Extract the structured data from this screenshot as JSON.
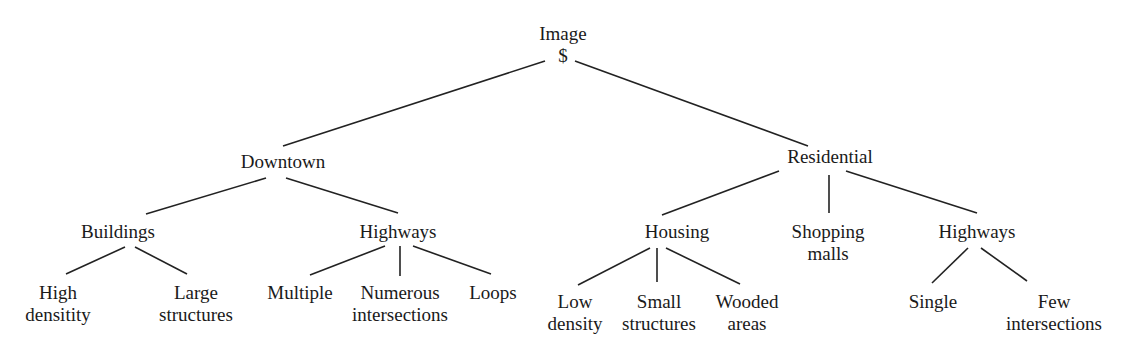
{
  "diagram": {
    "type": "tree",
    "root": {
      "label": "Image",
      "symbol": "$"
    },
    "level1": [
      {
        "id": "downtown",
        "label": "Downtown"
      },
      {
        "id": "residential",
        "label": "Residential"
      }
    ],
    "level2": [
      {
        "id": "buildings",
        "parent": "downtown",
        "lines": [
          "Buildings"
        ]
      },
      {
        "id": "highways_dt",
        "parent": "downtown",
        "lines": [
          "Highways"
        ]
      },
      {
        "id": "housing",
        "parent": "residential",
        "lines": [
          "Housing"
        ]
      },
      {
        "id": "shopping",
        "parent": "residential",
        "lines": [
          "Shopping",
          "malls"
        ]
      },
      {
        "id": "highways_res",
        "parent": "residential",
        "lines": [
          "Highways"
        ]
      }
    ],
    "level3": [
      {
        "id": "high_density",
        "parent": "buildings",
        "lines": [
          "High",
          "densitity"
        ]
      },
      {
        "id": "large_structures",
        "parent": "buildings",
        "lines": [
          "Large",
          "structures"
        ]
      },
      {
        "id": "multiple",
        "parent": "highways_dt",
        "lines": [
          "Multiple"
        ]
      },
      {
        "id": "numerous_intersections",
        "parent": "highways_dt",
        "lines": [
          "Numerous",
          "intersections"
        ]
      },
      {
        "id": "loops",
        "parent": "highways_dt",
        "lines": [
          "Loops"
        ]
      },
      {
        "id": "low_density",
        "parent": "housing",
        "lines": [
          "Low",
          "density"
        ]
      },
      {
        "id": "small_structures",
        "parent": "housing",
        "lines": [
          "Small",
          "structures"
        ]
      },
      {
        "id": "wooded_areas",
        "parent": "housing",
        "lines": [
          "Wooded",
          "areas"
        ]
      },
      {
        "id": "single",
        "parent": "highways_res",
        "lines": [
          "Single"
        ]
      },
      {
        "id": "few_intersections",
        "parent": "highways_res",
        "lines": [
          "Few",
          "intersections"
        ]
      }
    ]
  }
}
